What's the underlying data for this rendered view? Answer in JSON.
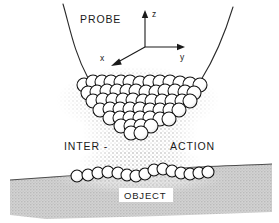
{
  "figure": {
    "background_color": "#ffffff"
  },
  "labels": {
    "probe": "PROBE",
    "interaction_left": "INTER -",
    "interaction_right": "ACTION",
    "object": "OBJECT"
  },
  "axes": {
    "z": "z",
    "y": "y",
    "x": "x",
    "origin": {
      "x": 145,
      "y": 47
    },
    "color": "#1a1a1a"
  },
  "colors": {
    "line": "#1a1a1a",
    "atom_fill": "#ffffff",
    "atom_outline": "#111111",
    "substrate_fill": "#c9c9c9",
    "substrate_outline": "#555555",
    "stipple": "#9a9a9a",
    "label_text": "#1a1a1a"
  },
  "probe": {
    "left_curve": "M63,4 C70,28 74,52 88,78",
    "right_curve": "M233,7 C226,30 216,56 201,80"
  },
  "tip_cluster": {
    "description": "inverted wedge of spherical atoms forming the probe apex",
    "radius": 7.0,
    "atoms": [
      [
        84,
        85
      ],
      [
        93,
        82
      ],
      [
        102,
        82
      ],
      [
        111,
        82
      ],
      [
        121,
        82
      ],
      [
        130,
        82
      ],
      [
        140,
        83
      ],
      [
        150,
        82
      ],
      [
        160,
        82
      ],
      [
        170,
        82
      ],
      [
        180,
        83
      ],
      [
        190,
        84
      ],
      [
        200,
        85
      ],
      [
        88,
        93
      ],
      [
        97,
        92
      ],
      [
        107,
        91
      ],
      [
        117,
        91
      ],
      [
        127,
        91
      ],
      [
        136,
        91
      ],
      [
        146,
        92
      ],
      [
        156,
        92
      ],
      [
        165,
        91
      ],
      [
        175,
        91
      ],
      [
        185,
        92
      ],
      [
        194,
        93
      ],
      [
        93,
        101
      ],
      [
        103,
        100
      ],
      [
        113,
        100
      ],
      [
        123,
        100
      ],
      [
        133,
        100
      ],
      [
        143,
        101
      ],
      [
        152,
        101
      ],
      [
        162,
        101
      ],
      [
        172,
        101
      ],
      [
        182,
        101
      ],
      [
        190,
        101
      ],
      [
        100,
        110
      ],
      [
        110,
        109
      ],
      [
        120,
        109
      ],
      [
        130,
        109
      ],
      [
        140,
        109
      ],
      [
        150,
        110
      ],
      [
        160,
        110
      ],
      [
        170,
        110
      ],
      [
        179,
        110
      ],
      [
        110,
        118
      ],
      [
        120,
        118
      ],
      [
        130,
        118
      ],
      [
        140,
        118
      ],
      [
        150,
        118
      ],
      [
        160,
        119
      ],
      [
        169,
        119
      ],
      [
        121,
        126
      ],
      [
        131,
        126
      ],
      [
        141,
        126
      ],
      [
        151,
        126
      ],
      [
        131,
        133
      ],
      [
        141,
        133
      ]
    ]
  },
  "surface_atoms": {
    "description": "single wavy row of adsorbed atoms on the object surface",
    "radius": 6.0,
    "atoms": [
      [
        77,
        176
      ],
      [
        88,
        175
      ],
      [
        98,
        173
      ],
      [
        108,
        172
      ],
      [
        118,
        173
      ],
      [
        127,
        175
      ],
      [
        136,
        176
      ],
      [
        145,
        174
      ],
      [
        154,
        170
      ],
      [
        163,
        169
      ],
      [
        172,
        171
      ],
      [
        181,
        173
      ],
      [
        190,
        174
      ],
      [
        199,
        173
      ],
      [
        208,
        172
      ]
    ]
  },
  "substrate": {
    "top_path": "M10,180 C60,176 120,172 180,168 C215,166 250,165 272,164",
    "shape_path": "M10,180 C60,176 120,172 180,168 C215,166 250,165 272,164 L272,212 C200,215 120,217 46,219 L10,215 Z",
    "fill": "#c9c9c9"
  },
  "stipple_cloud": {
    "description": "dotted interaction field between probe apex and surface",
    "center_x": 140,
    "top_y": 80,
    "bottom_y": 172
  }
}
